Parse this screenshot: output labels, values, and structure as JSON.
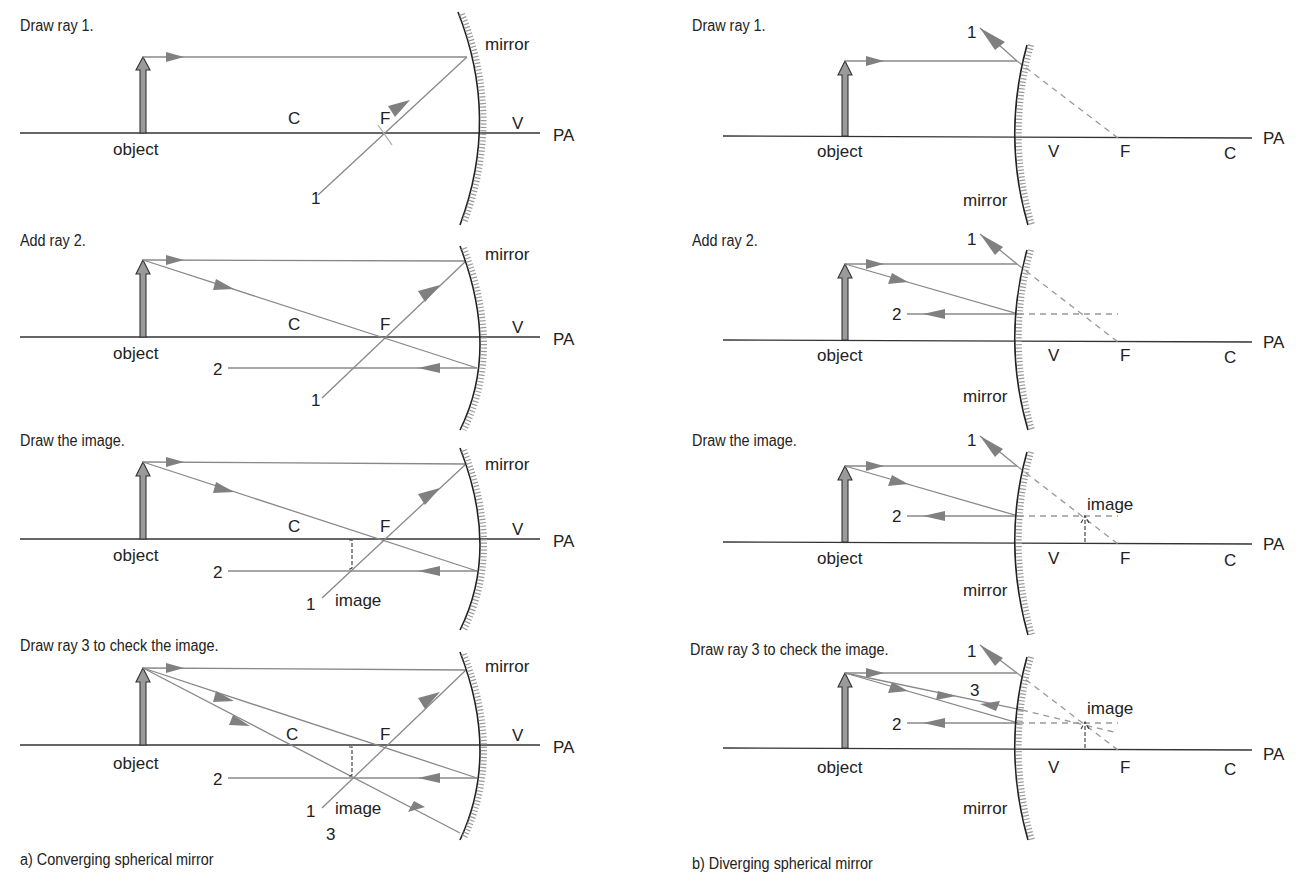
{
  "colors": {
    "ray": "#888888",
    "axis": "#333333",
    "object_fill": "#9a9a9a",
    "text": "#222222"
  },
  "labels": {
    "object": "object",
    "mirror": "mirror",
    "image": "image",
    "C": "C",
    "F": "F",
    "V": "V",
    "PA": "PA",
    "ray1": "1",
    "ray2": "2",
    "ray3": "3"
  },
  "converging": {
    "caption": "a)  Converging spherical mirror",
    "steps": [
      {
        "title": "Draw ray 1."
      },
      {
        "title": "Add ray 2."
      },
      {
        "title": "Draw the image."
      },
      {
        "title": "Draw ray 3 to check the image."
      }
    ]
  },
  "diverging": {
    "caption": "b)  Diverging spherical mirror",
    "steps": [
      {
        "title": "Draw ray 1."
      },
      {
        "title": "Add ray 2."
      },
      {
        "title": "Draw the image."
      },
      {
        "title": "Draw ray 3 to check the image."
      }
    ]
  }
}
